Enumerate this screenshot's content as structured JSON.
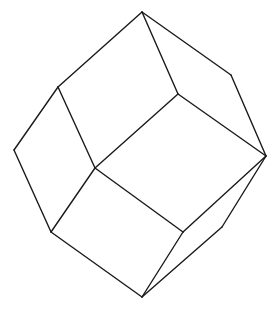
{
  "diagram": {
    "stroke_color": "#1a1a1a",
    "background": "#ffffff",
    "vertices": {
      "top": [
        142,
        12
      ],
      "upper_right": [
        231,
        75
      ],
      "right_tip": [
        266,
        156
      ],
      "inner_center": [
        178,
        94
      ],
      "left_upper": [
        58,
        87
      ],
      "left": [
        14,
        150
      ],
      "mid_junction": [
        95,
        168
      ],
      "lower_left": [
        51,
        232
      ],
      "lower_center": [
        183,
        232
      ],
      "right_lower": [
        222,
        227
      ],
      "bottom": [
        142,
        297
      ]
    },
    "edges": [
      [
        "top",
        "left_upper"
      ],
      [
        "top",
        "upper_right"
      ],
      [
        "top",
        "inner_center"
      ],
      [
        "upper_right",
        "right_tip"
      ],
      [
        "inner_center",
        "right_tip"
      ],
      [
        "inner_center",
        "mid_junction"
      ],
      [
        "left_upper",
        "left"
      ],
      [
        "left_upper",
        "mid_junction"
      ],
      [
        "left",
        "lower_left"
      ],
      [
        "mid_junction",
        "lower_left"
      ],
      [
        "mid_junction",
        "lower_center"
      ],
      [
        "lower_left",
        "bottom"
      ],
      [
        "lower_center",
        "bottom"
      ],
      [
        "lower_center",
        "right_tip"
      ],
      [
        "right_tip",
        "right_lower"
      ],
      [
        "right_lower",
        "bottom"
      ]
    ]
  }
}
